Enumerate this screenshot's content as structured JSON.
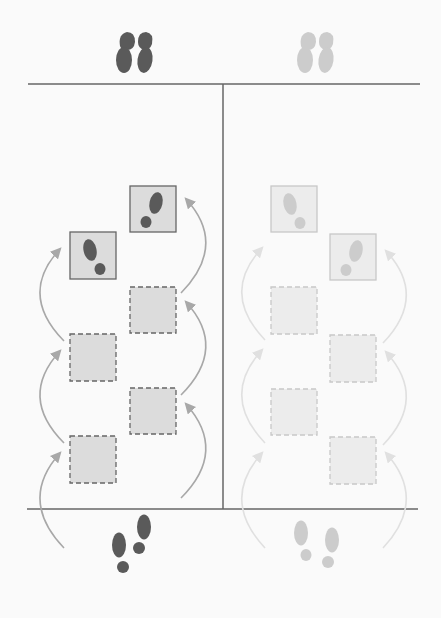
{
  "diagram": {
    "title": "",
    "colors": {
      "background": "#fafafa",
      "line": "#666666",
      "dark_foot": "#5a5a5a",
      "light_foot": "#cccccc",
      "dark_arrow": "#a8a8a8",
      "light_arrow": "#e0e0e0",
      "dark_box_fill": "#dcdcdc",
      "dark_box_stroke": "#666666",
      "light_box_fill": "#ececec",
      "light_box_stroke": "#c8c8c8"
    },
    "panels": [
      {
        "name": "left-panel",
        "shade": "dark",
        "start_feet": "bottom",
        "end_feet": "top",
        "steps": [
          {
            "x": 70,
            "y": 436,
            "type": "dashed"
          },
          {
            "x": 130,
            "y": 388,
            "type": "dashed"
          },
          {
            "x": 70,
            "y": 334,
            "type": "dashed"
          },
          {
            "x": 130,
            "y": 287,
            "type": "dashed"
          },
          {
            "x": 70,
            "y": 232,
            "type": "footprint",
            "foot": "left"
          },
          {
            "x": 130,
            "y": 186,
            "type": "footprint",
            "foot": "right"
          }
        ]
      },
      {
        "name": "right-panel",
        "shade": "light",
        "start_feet": "bottom",
        "end_feet": "top",
        "steps": [
          {
            "x": 330,
            "y": 437,
            "type": "dashed"
          },
          {
            "x": 271,
            "y": 389,
            "type": "dashed"
          },
          {
            "x": 330,
            "y": 335,
            "type": "dashed"
          },
          {
            "x": 271,
            "y": 287,
            "type": "dashed"
          },
          {
            "x": 330,
            "y": 234,
            "type": "footprint",
            "foot": "right"
          },
          {
            "x": 271,
            "y": 186,
            "type": "footprint",
            "foot": "left"
          }
        ]
      }
    ]
  }
}
